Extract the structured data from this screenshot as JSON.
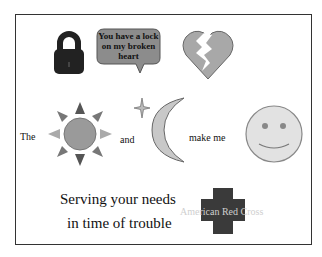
{
  "poster": {
    "speech_bubble": {
      "line1": "You have a lock",
      "line2": "on my broken",
      "line3": "heart"
    },
    "rebus": {
      "word_the": "The",
      "word_and": "and",
      "word_make_me": "make me"
    },
    "slogan": {
      "line1": "Serving your needs",
      "line2": "in time of trouble"
    },
    "logo_text": "American Red Cross",
    "icons": [
      "padlock-icon",
      "speech-bubble",
      "broken-heart-icon",
      "sun-icon",
      "star-icon",
      "crescent-moon-icon",
      "smiley-face-icon",
      "red-cross-icon"
    ],
    "colors": {
      "frame": "#333333",
      "lock": "#222222",
      "bubble_fill": "#8c8c8c",
      "heart_fill": "#a8a8a8",
      "sun_fill": "#9a9a9a",
      "moon_fill": "#c8c8c8",
      "smiley_fill": "#e2e2e2",
      "cross_fill": "#3a3a3a"
    }
  }
}
